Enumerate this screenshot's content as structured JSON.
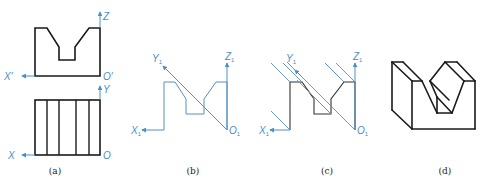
{
  "colors": {
    "outline": "#1a1a1a",
    "axis": "#4a90c8",
    "thin_line": "#5a8fc0",
    "label": "#222222",
    "background": "#ffffff"
  },
  "panels": [
    {
      "id": "a",
      "caption": "(a)",
      "caption_pos": [
        55,
        174
      ],
      "description": "Orthographic front and top views with axes",
      "axes": [
        {
          "name": "Z",
          "label": "Z",
          "from": [
            100,
            28
          ],
          "to": [
            100,
            12
          ],
          "label_pos": [
            103,
            20
          ]
        },
        {
          "name": "X-prime",
          "label": "X′",
          "from": [
            35,
            76
          ],
          "to": [
            22,
            76
          ],
          "label_pos": [
            4,
            80
          ]
        },
        {
          "name": "O-prime",
          "label": "O′",
          "label_pos": [
            103,
            80
          ]
        },
        {
          "name": "Y",
          "label": "Y",
          "from": [
            100,
            100
          ],
          "to": [
            100,
            86
          ],
          "label_pos": [
            103,
            93
          ]
        },
        {
          "name": "X",
          "label": "X",
          "from": [
            35,
            155
          ],
          "to": [
            22,
            155
          ],
          "label_pos": [
            8,
            159
          ]
        },
        {
          "name": "O",
          "label": "O",
          "label_pos": [
            103,
            159
          ]
        }
      ],
      "front_view": [
        [
          35,
          28
        ],
        [
          47,
          28
        ],
        [
          59,
          47
        ],
        [
          59,
          60
        ],
        [
          75,
          60
        ],
        [
          75,
          47
        ],
        [
          89,
          28
        ],
        [
          100,
          28
        ],
        [
          100,
          76
        ],
        [
          35,
          76
        ]
      ],
      "top_view": {
        "x": 35,
        "y": 100,
        "w": 65,
        "h": 55,
        "verticals": [
          47,
          59,
          76,
          89
        ]
      }
    },
    {
      "id": "b",
      "caption": "(b)",
      "caption_pos": [
        193,
        174
      ],
      "description": "Front view with oblique Y1 axis",
      "axes": [
        {
          "name": "Z1",
          "label": "Z",
          "sub": "1",
          "from": [
            227,
            130
          ],
          "to": [
            227,
            63
          ],
          "label_pos": [
            225,
            60
          ]
        },
        {
          "name": "X1",
          "label": "X",
          "sub": "1",
          "from": [
            164,
            130
          ],
          "to": [
            142,
            130
          ],
          "label_pos": [
            131,
            134
          ]
        },
        {
          "name": "Y1",
          "label": "Y",
          "sub": "1",
          "from": [
            227,
            130
          ],
          "to": [
            163,
            66
          ],
          "label_pos": [
            152,
            62
          ]
        },
        {
          "name": "O1",
          "label": "O",
          "sub": "1",
          "label_pos": [
            229,
            134
          ]
        }
      ],
      "outline": [
        [
          164,
          130
        ],
        [
          164,
          82
        ],
        [
          175,
          82
        ],
        [
          186,
          99
        ],
        [
          186,
          114
        ],
        [
          204,
          114
        ],
        [
          204,
          99
        ],
        [
          216,
          82
        ],
        [
          227,
          82
        ],
        [
          227,
          130
        ]
      ]
    },
    {
      "id": "c",
      "caption": "(c)",
      "caption_pos": [
        327,
        174
      ],
      "description": "Front view with parallel projection lines",
      "axes": [
        {
          "name": "Z1",
          "label": "Z",
          "sub": "1",
          "from": [
            355,
            130
          ],
          "to": [
            355,
            63
          ],
          "label_pos": [
            353,
            60
          ]
        },
        {
          "name": "X1",
          "label": "X",
          "sub": "1",
          "from": [
            290,
            130
          ],
          "to": [
            270,
            130
          ],
          "label_pos": [
            259,
            134
          ]
        },
        {
          "name": "Y1",
          "label": "Y",
          "sub": "1",
          "from": [
            301,
            76
          ],
          "to": [
            295,
            70
          ],
          "label_pos": [
            286,
            62
          ]
        },
        {
          "name": "O1",
          "label": "O",
          "sub": "1",
          "label_pos": [
            357,
            134
          ]
        }
      ],
      "outline": [
        [
          290,
          130
        ],
        [
          290,
          82
        ],
        [
          302,
          82
        ],
        [
          314,
          99
        ],
        [
          314,
          114
        ],
        [
          331,
          114
        ],
        [
          331,
          99
        ],
        [
          344,
          82
        ],
        [
          355,
          82
        ],
        [
          355,
          130
        ]
      ],
      "projection_lines": [
        [
          [
            290,
            82
          ],
          [
            271,
            63
          ]
        ],
        [
          [
            302,
            82
          ],
          [
            283,
            63
          ]
        ],
        [
          [
            355,
            130
          ],
          [
            287,
            62
          ]
        ],
        [
          [
            331,
            114
          ],
          [
            297,
            80
          ]
        ],
        [
          [
            314,
            99
          ],
          [
            312,
            97
          ]
        ],
        [
          [
            344,
            82
          ],
          [
            325,
            63
          ]
        ],
        [
          [
            355,
            82
          ],
          [
            336,
            63
          ]
        ],
        [
          [
            290,
            130
          ],
          [
            271,
            111
          ]
        ],
        [
          [
            331,
            114
          ],
          [
            314,
            97
          ]
        ]
      ]
    },
    {
      "id": "d",
      "caption": "(d)",
      "caption_pos": [
        445,
        174
      ],
      "description": "Oblique pictorial of V-block",
      "edges": [
        [
          [
            392,
            62
          ],
          [
            403,
            62
          ]
        ],
        [
          [
            392,
            62
          ],
          [
            412,
            81
          ]
        ],
        [
          [
            403,
            62
          ],
          [
            422,
            81
          ]
        ],
        [
          [
            392,
            62
          ],
          [
            392,
            110
          ]
        ],
        [
          [
            392,
            110
          ],
          [
            412,
            129
          ]
        ],
        [
          [
            412,
            81
          ],
          [
            412,
            129
          ]
        ],
        [
          [
            412,
            81
          ],
          [
            422,
            81
          ]
        ],
        [
          [
            412,
            129
          ],
          [
            475,
            129
          ]
        ],
        [
          [
            475,
            81
          ],
          [
            475,
            129
          ]
        ],
        [
          [
            422,
            81
          ],
          [
            437,
            113
          ]
        ],
        [
          [
            437,
            97
          ],
          [
            452,
            113
          ]
        ],
        [
          [
            437,
            113
          ],
          [
            452,
            113
          ]
        ],
        [
          [
            437,
            97
          ],
          [
            437,
            113
          ]
        ],
        [
          [
            430,
            81
          ],
          [
            437,
            97
          ]
        ],
        [
          [
            445,
            62
          ],
          [
            457,
            62
          ]
        ],
        [
          [
            445,
            62
          ],
          [
            430,
            81
          ]
        ],
        [
          [
            457,
            62
          ],
          [
            475,
            81
          ]
        ],
        [
          [
            445,
            62
          ],
          [
            464,
            81
          ]
        ],
        [
          [
            464,
            81
          ],
          [
            475,
            81
          ]
        ],
        [
          [
            464,
            81
          ],
          [
            452,
            113
          ]
        ],
        [
          [
            430,
            81
          ],
          [
            449,
            100
          ]
        ]
      ]
    }
  ]
}
